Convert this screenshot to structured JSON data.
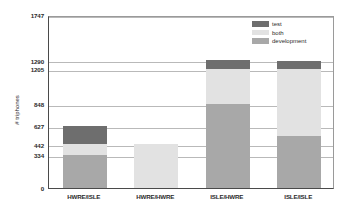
{
  "chart_data": {
    "type": "bar",
    "stacked": true,
    "title": "",
    "xlabel": "",
    "ylabel": "# triphones",
    "ylim": [
      0,
      1747
    ],
    "grid": true,
    "legend_position": "top-right",
    "categories": [
      "HWRE/ISLE",
      "HWRE/HWRE",
      "ISLE/HWRE",
      "ISLE/ISLE"
    ],
    "ytick_labels": [
      "1747",
      "1290",
      "1205",
      "848",
      "627",
      "442",
      "334",
      "0"
    ],
    "ytick_values": [
      1747,
      1290,
      1205,
      848,
      627,
      442,
      334,
      0
    ],
    "series": [
      {
        "name": "development",
        "color": "#a8a8a8",
        "values": [
          334,
          0,
          848,
          530
        ]
      },
      {
        "name": "both",
        "color": "#e2e2e2",
        "values": [
          108,
          442,
          357,
          675
        ]
      },
      {
        "name": "test",
        "color": "#6e6e6e",
        "values": [
          185,
          0,
          85,
          75
        ]
      }
    ],
    "totals": [
      627,
      442,
      1290,
      1280
    ],
    "segment_tops": {
      "HWRE/ISLE": {
        "development": 334,
        "both": 442,
        "test": 627
      },
      "HWRE/HWRE": {
        "development": 0,
        "both": 442,
        "test": 442
      },
      "ISLE/HWRE": {
        "development": 848,
        "both": 1205,
        "test": 1290
      },
      "ISLE/ISLE": {
        "development": 530,
        "both": 1205,
        "test": 1280
      }
    }
  },
  "legend": {
    "items": [
      {
        "label": "test",
        "color": "#6e6e6e"
      },
      {
        "label": "both",
        "color": "#e2e2e2"
      },
      {
        "label": "development",
        "color": "#a8a8a8"
      }
    ]
  },
  "axis": {
    "y_title": "# triphones",
    "y_ticks": [
      {
        "label": "1747",
        "value": 1747
      },
      {
        "label": "1290",
        "value": 1290
      },
      {
        "label": "1205",
        "value": 1205
      },
      {
        "label": "848",
        "value": 848
      },
      {
        "label": "627",
        "value": 627
      },
      {
        "label": "442",
        "value": 442
      },
      {
        "label": "334",
        "value": 334
      },
      {
        "label": "0",
        "value": 0
      }
    ],
    "x_ticks": [
      "HWRE/ISLE",
      "HWRE/HWRE",
      "ISLE/HWRE",
      "ISLE/ISLE"
    ]
  },
  "colors": {
    "test": "#6e6e6e",
    "both": "#e2e2e2",
    "development": "#a8a8a8",
    "axis": "#4a4a4a",
    "grid": "#b9b9b9",
    "background": "#ffffff"
  }
}
